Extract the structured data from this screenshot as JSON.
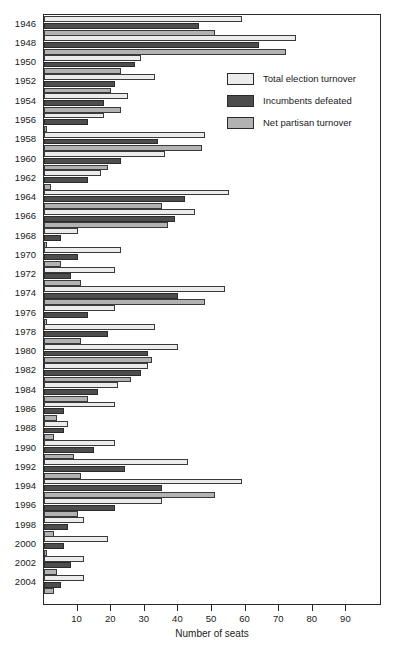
{
  "chart_data": {
    "type": "bar",
    "orientation": "horizontal",
    "title": "",
    "xlabel": "Number of seats",
    "ylabel": "",
    "xlim": [
      0,
      100
    ],
    "xticks": [
      10,
      20,
      30,
      40,
      50,
      60,
      70,
      80,
      90
    ],
    "grid": false,
    "legend_position": "upper right",
    "categories": [
      "1946",
      "1948",
      "1950",
      "1952",
      "1954",
      "1956",
      "1958",
      "1960",
      "1962",
      "1964",
      "1966",
      "1968",
      "1970",
      "1972",
      "1974",
      "1976",
      "1978",
      "1980",
      "1982",
      "1984",
      "1986",
      "1988",
      "1990",
      "1992",
      "1994",
      "1996",
      "1998",
      "2000",
      "2002",
      "2004"
    ],
    "series": [
      {
        "name": "Total election turnover",
        "color": "#ececec",
        "values": [
          59,
          75,
          29,
          33,
          25,
          18,
          48,
          36,
          17,
          55,
          45,
          10,
          23,
          21,
          54,
          21,
          33,
          40,
          31,
          22,
          21,
          7,
          21,
          43,
          59,
          35,
          12,
          19,
          12,
          12
        ]
      },
      {
        "name": "Incumbents defeated",
        "color": "#4d4d4d",
        "values": [
          46,
          64,
          27,
          21,
          18,
          13,
          34,
          23,
          13,
          42,
          39,
          5,
          10,
          8,
          40,
          13,
          19,
          31,
          29,
          16,
          6,
          6,
          15,
          24,
          35,
          21,
          7,
          6,
          8,
          5
        ]
      },
      {
        "name": "Net partisan turnover",
        "color": "#b2b2b2",
        "values": [
          51,
          72,
          23,
          20,
          23,
          1,
          47,
          19,
          2,
          35,
          37,
          1,
          5,
          11,
          48,
          1,
          11,
          32,
          26,
          13,
          4,
          3,
          9,
          11,
          51,
          10,
          3,
          1,
          4,
          3
        ]
      }
    ]
  },
  "legend": {
    "items": [
      {
        "label": "Total election turnover",
        "swatch": "total"
      },
      {
        "label": "Incumbents defeated",
        "swatch": "incumbent"
      },
      {
        "label": "Net partisan turnover",
        "swatch": "net"
      }
    ]
  },
  "axis": {
    "x_title": "Number of seats"
  }
}
